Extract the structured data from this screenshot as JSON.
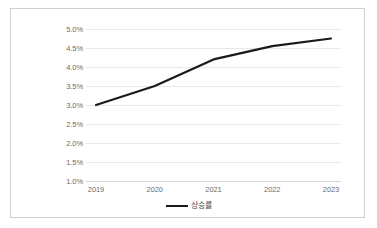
{
  "chart_data": {
    "type": "line",
    "title": "",
    "subtitle": "",
    "xlabel": "",
    "ylabel": "",
    "categories": [
      "2019",
      "2020",
      "2021",
      "2022",
      "2023"
    ],
    "series": [
      {
        "name": "상승률",
        "values": [
          3.0,
          3.5,
          4.2,
          4.55,
          4.75
        ],
        "color": "#1a1a1a"
      }
    ],
    "y_ticks": [
      "5.0%",
      "4.5%",
      "4.0%",
      "3.5%",
      "3.0%",
      "2.5%",
      "2.0%",
      "1.5%",
      "1.0%"
    ],
    "y_tick_values": [
      5.0,
      4.5,
      4.0,
      3.5,
      3.0,
      2.5,
      2.0,
      1.5,
      1.0
    ],
    "ylim": [
      1.0,
      5.0
    ],
    "y_unit": "%",
    "grid": true,
    "grid_axis": "y",
    "legend": true,
    "legend_position": "bottom",
    "legend_entries": [
      "상승률"
    ],
    "annotations": []
  },
  "legend": {
    "label": "상승률",
    "swatch_name": "line-swatch"
  },
  "colors": {
    "series_line": "#1a1a1a",
    "gridline": "#e8e8e8",
    "frame_border": "#d0d0d0",
    "tick_text": "#6b6b6b",
    "plot_background": "#ffffff"
  }
}
